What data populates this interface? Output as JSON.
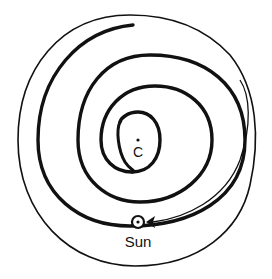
{
  "diagram": {
    "title": "",
    "labels": {
      "center": "C",
      "sun": "Sun"
    },
    "colors": {
      "ink": "#111111",
      "background": "#ffffff"
    },
    "elements": {
      "outer_boundary": "outer circle",
      "spiral_arm": "thick spiral arm winding inward to center C",
      "sun_marker": "circled dot on spiral orbit with arrow indicating direction of motion"
    }
  }
}
